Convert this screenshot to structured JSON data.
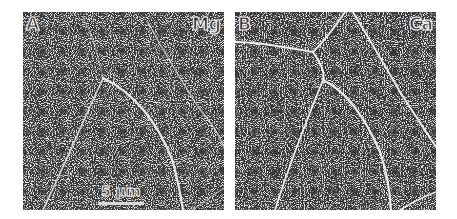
{
  "figure": {
    "panels": [
      {
        "id": "A",
        "panel_label": "A",
        "element_label": "Mg",
        "scale_bar": "5 µm"
      },
      {
        "id": "B",
        "panel_label": "B",
        "element_label": "Ca"
      }
    ],
    "colors": {
      "background": "#3a3a3a",
      "speckle": "#d9d9d9",
      "boundary": "#e6e6e6",
      "page": "#ffffff"
    }
  }
}
